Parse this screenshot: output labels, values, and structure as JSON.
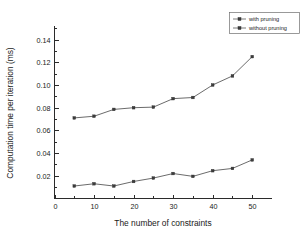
{
  "chart_data": {
    "type": "line",
    "title": "",
    "xlabel": "The number of constraints",
    "ylabel": "Computation time per iteration (ms)",
    "x": [
      5,
      10,
      15,
      20,
      25,
      30,
      35,
      40,
      45,
      50
    ],
    "series": [
      {
        "name": "with pruning",
        "values": [
          0.011,
          0.013,
          0.011,
          0.015,
          0.018,
          0.022,
          0.0195,
          0.0245,
          0.0265,
          0.034
        ]
      },
      {
        "name": "without pruning",
        "values": [
          0.071,
          0.0725,
          0.0785,
          0.08,
          0.0805,
          0.088,
          0.089,
          0.1,
          0.108,
          0.125
        ]
      }
    ],
    "xlim": [
      0,
      55
    ],
    "ylim": [
      0.0,
      0.152
    ],
    "xticks": [
      0,
      10,
      20,
      30,
      40,
      50
    ],
    "xtick_labels": [
      "0",
      "10",
      "20",
      "30",
      "40",
      "50"
    ],
    "xticks_minor": [
      5,
      15,
      25,
      35,
      45
    ],
    "yticks": [
      0.02,
      0.04,
      0.06,
      0.08,
      0.1,
      0.12,
      0.14
    ],
    "ytick_labels": [
      "0.02",
      "0.04",
      "0.06",
      "0.08",
      "0.10",
      "0.12",
      "0.14"
    ],
    "yticks_minor": [
      0.01,
      0.03,
      0.05,
      0.07,
      0.09,
      0.11,
      0.13,
      0.15
    ],
    "grid": false,
    "legend_position": "top-right-outside",
    "marker": "square",
    "colors": {
      "line": "#5a5a5a",
      "marker": "#3d3d3d",
      "axis": "#2b2b2b",
      "background": "#ffffff"
    }
  },
  "legend": {
    "entries": [
      {
        "label": "with pruning"
      },
      {
        "label": "without pruning"
      }
    ]
  },
  "axes": {
    "x_title": "The number of constraints",
    "y_title": "Computation time per iteration (ms)"
  }
}
